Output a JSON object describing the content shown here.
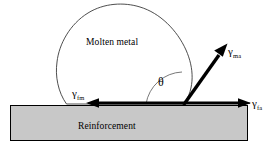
{
  "figure": {
    "width": 276,
    "height": 156,
    "background_color": "#ffffff",
    "line_color": "#000000",
    "substrate_fill_color": "#c8c8c8",
    "substrate_border_color": "#000000",
    "droplet_fill_color": "#ffffff"
  },
  "labels": {
    "droplet": "Molten metal",
    "substrate": "Reinforcement",
    "contact_angle": "θ",
    "gamma_symbol": "γ",
    "gamma_fm_sub": "fm",
    "gamma_ma_sub": "ma",
    "gamma_fa_sub": "fa"
  },
  "vectors": [
    {
      "name": "gamma-fm",
      "symbol": "γ",
      "subscript": "fm",
      "meaning": "reinforcement–molten metal interfacial tension",
      "direction": "left",
      "from": [
        184,
        103
      ],
      "to": [
        88,
        103
      ]
    },
    {
      "name": "gamma-fa",
      "symbol": "γ",
      "subscript": "fa",
      "meaning": "reinforcement–atmosphere interfacial tension",
      "direction": "right",
      "from": [
        184,
        103
      ],
      "to": [
        250,
        103
      ]
    },
    {
      "name": "gamma-ma",
      "symbol": "γ",
      "subscript": "ma",
      "meaning": "molten metal–atmosphere surface tension",
      "direction": "up-right",
      "from": [
        184,
        104
      ],
      "to": [
        227,
        44
      ]
    }
  ],
  "geometry": {
    "substrate_rect": {
      "x": 10,
      "y": 105,
      "width": 238,
      "height": 36
    },
    "droplet_contact_left": [
      66,
      104
    ],
    "droplet_contact_right": [
      184,
      104
    ],
    "droplet_top": [
      124,
      5
    ],
    "angle_arc_label": "θ"
  }
}
